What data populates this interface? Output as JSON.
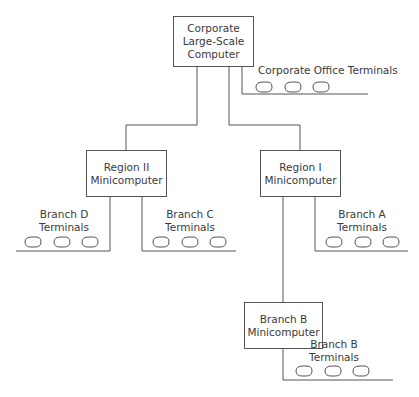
{
  "diagram": {
    "type": "network-hierarchy",
    "nodes": {
      "corporate": {
        "lines": [
          "Corporate",
          "Large-Scale",
          "Computer"
        ]
      },
      "region2": {
        "lines": [
          "Region II",
          "Minicomputer"
        ]
      },
      "region1": {
        "lines": [
          "Region I",
          "Minicomputer"
        ]
      },
      "branchB": {
        "lines": [
          "Branch B",
          "Minicomputer"
        ]
      }
    },
    "terminal_groups": {
      "corporate_office": {
        "label": "Corporate Office Terminals",
        "count": 3
      },
      "branchD": {
        "lines": [
          "Branch D",
          "Terminals"
        ],
        "count": 3
      },
      "branchC": {
        "lines": [
          "Branch C",
          "Terminals"
        ],
        "count": 3
      },
      "branchA": {
        "lines": [
          "Branch A",
          "Terminals"
        ],
        "count": 3
      },
      "branchB": {
        "lines": [
          "Branch B",
          "Terminals"
        ],
        "count": 3
      }
    },
    "edges": [
      [
        "Corporate Large-Scale Computer",
        "Corporate Office Terminals"
      ],
      [
        "Corporate Large-Scale Computer",
        "Region II Minicomputer"
      ],
      [
        "Corporate Large-Scale Computer",
        "Region I Minicomputer"
      ],
      [
        "Region II Minicomputer",
        "Branch D Terminals"
      ],
      [
        "Region II Minicomputer",
        "Branch C Terminals"
      ],
      [
        "Region I Minicomputer",
        "Branch A Terminals"
      ],
      [
        "Region I Minicomputer",
        "Branch B Minicomputer"
      ],
      [
        "Branch B Minicomputer",
        "Branch B Terminals"
      ]
    ],
    "colors": {
      "line": "#555555",
      "text": "#3a3a3a",
      "background": "#ffffff"
    }
  }
}
